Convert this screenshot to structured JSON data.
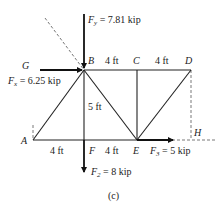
{
  "figure": {
    "caption": "(c)",
    "nodes": {
      "A": "A",
      "B": "B",
      "C": "C",
      "D": "D",
      "E": "E",
      "F": "F",
      "G": "G",
      "H": "H"
    },
    "dimensions": {
      "BC": "4 ft",
      "CD": "4 ft",
      "AF": "4 ft",
      "FE": "4 ft",
      "BF": "5 ft"
    },
    "forces": {
      "Fy": {
        "symbol": "F",
        "sub": "y",
        "value": " = 7.81 kip"
      },
      "Fx": {
        "symbol": "F",
        "sub": "x",
        "value": " = 6.25 kip"
      },
      "F2": {
        "symbol": "F",
        "sub": "2",
        "value": " = 8 kip"
      },
      "F3": {
        "symbol": "F",
        "sub": "3",
        "value": " = 5 kip"
      }
    }
  }
}
